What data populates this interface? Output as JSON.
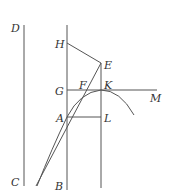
{
  "figure": {
    "type": "geometric-construction",
    "labels": {
      "D": "D",
      "H": "H",
      "E": "E",
      "G": "G",
      "F": "F",
      "K": "K",
      "M": "M",
      "A": "A",
      "L": "L",
      "C": "C",
      "B": "B"
    },
    "colors": {
      "line": "#555555",
      "text": "#333333",
      "background": "#ffffff"
    }
  }
}
